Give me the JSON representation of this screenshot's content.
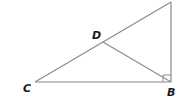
{
  "diagram": {
    "type": "geometry-right-triangle",
    "line_color": "#8a8a8a",
    "label_color": "#1a1a1a",
    "points": {
      "C": {
        "label": "C",
        "x": 35,
        "y": 82
      },
      "B": {
        "label": "B",
        "x": 171,
        "y": 82
      },
      "A": {
        "label": "",
        "x": 171,
        "y": 2
      },
      "D": {
        "label": "D",
        "x": 103,
        "y": 42
      }
    },
    "segments": [
      {
        "from": "C",
        "to": "B"
      },
      {
        "from": "B",
        "to": "A"
      },
      {
        "from": "C",
        "to": "A"
      },
      {
        "from": "D",
        "to": "B"
      }
    ],
    "right_angle_at": "B"
  }
}
